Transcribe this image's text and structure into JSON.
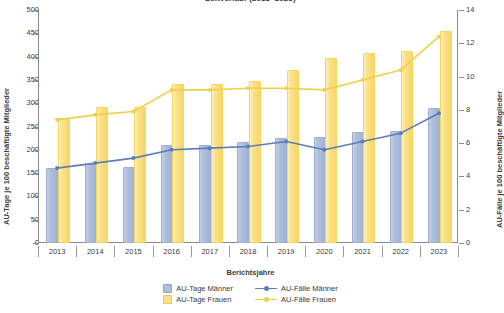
{
  "chart_data": {
    "type": "bar",
    "title": "Zeitverlauf (2013–2023)",
    "xlabel": "Berichtsjahre",
    "ylabel": "AU-Tage je 100 beschäftigte Mitglieder",
    "ylabel_secondary": "AU-Fälle je 100 beschäftigte Mitglieder",
    "categories": [
      "2013",
      "2014",
      "2015",
      "2016",
      "2017",
      "2018",
      "2019",
      "2020",
      "2021",
      "2022",
      "2023"
    ],
    "ylim": [
      0,
      500
    ],
    "yticks": [
      0,
      50,
      100,
      150,
      200,
      250,
      300,
      350,
      400,
      450,
      500
    ],
    "ylim_secondary": [
      0,
      14
    ],
    "yticks_secondary": [
      0,
      2,
      4,
      6,
      8,
      10,
      12,
      14
    ],
    "grid": false,
    "legend_position": "bottom",
    "series": [
      {
        "name": "AU-Tage Männer",
        "kind": "bar",
        "axis": "left",
        "color": "#aebfdc",
        "values": [
          157,
          165,
          158,
          206,
          207,
          213,
          222,
          224,
          233,
          236,
          285
        ]
      },
      {
        "name": "AU-Tage Frauen",
        "kind": "bar",
        "axis": "left",
        "color": "#fae08a",
        "values": [
          264,
          288,
          288,
          337,
          337,
          344,
          368,
          392,
          403,
          407,
          451
        ]
      },
      {
        "name": "AU-Fälle Männer",
        "kind": "line",
        "axis": "right",
        "color": "#5b7db8",
        "values": [
          4.5,
          4.8,
          5.1,
          5.6,
          5.7,
          5.8,
          6.1,
          5.6,
          6.1,
          6.6,
          7.8
        ]
      },
      {
        "name": "AU-Fälle Frauen",
        "kind": "line",
        "axis": "right",
        "color": "#f2cf4a",
        "values": [
          7.4,
          7.7,
          7.9,
          9.2,
          9.2,
          9.3,
          9.3,
          9.2,
          9.8,
          10.4,
          12.4
        ]
      }
    ]
  },
  "legend": {
    "items": [
      {
        "label": "AU-Tage Männer",
        "marker": "square",
        "color": "#aebfdc"
      },
      {
        "label": "AU-Fälle Männer",
        "marker": "line",
        "color": "#5b7db8"
      },
      {
        "label": "AU-Tage Frauen",
        "marker": "square",
        "color": "#fae08a"
      },
      {
        "label": "AU-Fälle Frauen",
        "marker": "line",
        "color": "#f2cf4a"
      }
    ]
  }
}
